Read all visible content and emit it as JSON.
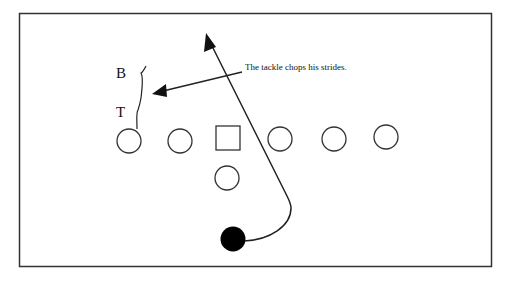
{
  "diagram": {
    "type": "football-play",
    "annotation": "The tackle chops his strides.",
    "labels": {
      "b": "B",
      "t": "T"
    },
    "offense_line": [
      {
        "shape": "circle",
        "cx": 129,
        "cy": 141
      },
      {
        "shape": "circle",
        "cx": 180,
        "cy": 141
      },
      {
        "shape": "square",
        "x": 216,
        "y": 125,
        "size": 24
      },
      {
        "shape": "circle",
        "cx": 280,
        "cy": 139
      },
      {
        "shape": "circle",
        "cx": 334,
        "cy": 139
      },
      {
        "shape": "circle",
        "cx": 386,
        "cy": 137
      }
    ],
    "backfield": [
      {
        "shape": "circle",
        "cx": 227,
        "cy": 178
      }
    ],
    "ball_carrier": {
      "shape": "filled-circle",
      "cx": 233,
      "cy": 239,
      "color": "#000000"
    },
    "colors": {
      "stroke": "#222222",
      "frame": "#333333",
      "background": "#ffffff"
    }
  }
}
